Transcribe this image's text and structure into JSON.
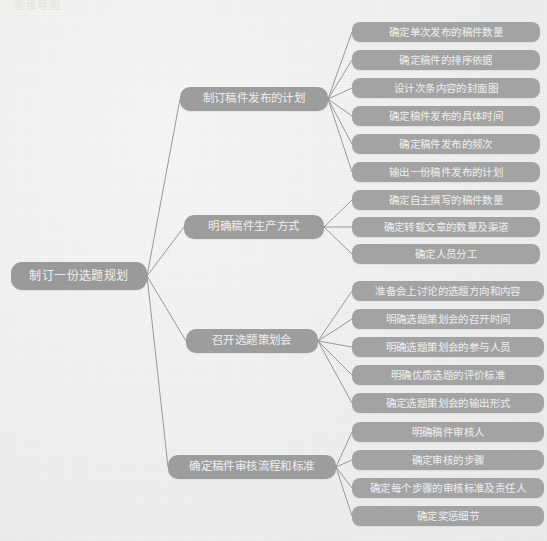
{
  "canvas": {
    "width": 547,
    "height": 541,
    "background": "#f0f0ee"
  },
  "watermark": {
    "text": "思维导图"
  },
  "colors": {
    "node_fill": "#9b9b9b",
    "node_text": "#eaeaea",
    "leaf_fill": "#a3a3a3",
    "line": "#8f8f8f",
    "background": "#f0f0ee"
  },
  "mindmap": {
    "root": {
      "label": "制订一份选题规划"
    },
    "branches": [
      {
        "label": "制订稿件发布的计划",
        "children": [
          {
            "label": "确定单次发布的稿件数量"
          },
          {
            "label": "确定稿件的排序依据"
          },
          {
            "label": "设计次条内容的封面图"
          },
          {
            "label": "确定稿件发布的具体时间"
          },
          {
            "label": "确定稿件发布的频次"
          },
          {
            "label": "输出一份稿件发布的计划"
          }
        ]
      },
      {
        "label": "明确稿件生产方式",
        "children": [
          {
            "label": "确定自主撰写的稿件数量"
          },
          {
            "label": "确定转载文章的数量及渠道"
          },
          {
            "label": "确定人员分工"
          }
        ]
      },
      {
        "label": "召开选题策划会",
        "children": [
          {
            "label": "准备会上讨论的选题方向和内容"
          },
          {
            "label": "明确选题策划会的召开时间"
          },
          {
            "label": "明确选题策划会的参与人员"
          },
          {
            "label": "明确优质选题的评价标准"
          },
          {
            "label": "确定选题策划会的输出形式"
          }
        ]
      },
      {
        "label": "确定稿件审核流程和标准",
        "children": [
          {
            "label": "明确稿件审核人"
          },
          {
            "label": "确定审核的步骤"
          },
          {
            "label": "确定每个步骤的审核标准及责任人"
          },
          {
            "label": "确定奖惩细节"
          }
        ]
      }
    ]
  },
  "geometry": {
    "root": {
      "x": 11,
      "y": 262,
      "w": 136,
      "h": 28
    },
    "branches": [
      {
        "x": 180,
        "y": 87,
        "w": 148,
        "h": 24,
        "children_x": 352,
        "children_w": 188,
        "children_h": 20,
        "children_y": [
          22,
          50,
          78,
          106,
          134,
          162
        ]
      },
      {
        "x": 184,
        "y": 215,
        "w": 140,
        "h": 24,
        "children_x": 352,
        "children_w": 188,
        "children_h": 20,
        "children_y": [
          190,
          217,
          244
        ]
      },
      {
        "x": 186,
        "y": 329,
        "w": 132,
        "h": 24,
        "children_x": 352,
        "children_w": 192,
        "children_h": 20,
        "children_y": [
          281,
          309,
          337,
          365,
          393
        ]
      },
      {
        "x": 168,
        "y": 455,
        "w": 168,
        "h": 24,
        "children_x": 352,
        "children_w": 192,
        "children_h": 20,
        "children_y": [
          422,
          450,
          478,
          506
        ]
      }
    ]
  }
}
